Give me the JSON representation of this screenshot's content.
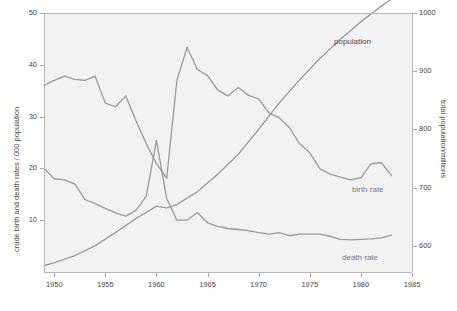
{
  "chart_data": {
    "type": "line",
    "title": "",
    "xlabel": "",
    "ylabel": "crude birth and death rates / 000 population",
    "y2label": "total population/millions",
    "xlim": [
      1949,
      1985
    ],
    "ylim": [
      0,
      50
    ],
    "y2lim": [
      555,
      1000
    ],
    "grid": false,
    "legend_position": "inline-annotations",
    "xticks": [
      "1950",
      "1955",
      "1960",
      "1965",
      "1970",
      "1975",
      "1980",
      "1985"
    ],
    "xtick_values": [
      1950,
      1955,
      1960,
      1965,
      1970,
      1975,
      1980,
      1985
    ],
    "yticks": [
      "10",
      "20",
      "30",
      "40",
      "50"
    ],
    "ytick_values": [
      10,
      20,
      30,
      40,
      50
    ],
    "y2ticks": [
      "600",
      "700",
      "800",
      "900",
      "1000"
    ],
    "y2tick_values": [
      600,
      700,
      800,
      900,
      1000
    ],
    "annotations": [
      {
        "text": "population",
        "x": 1977.5,
        "y_axis": "right"
      },
      {
        "text": "birth rate",
        "x": 1979.0,
        "y_axis": "left"
      },
      {
        "text": "death rate",
        "x": 1978.0,
        "y_axis": "left"
      }
    ],
    "series": [
      {
        "name": "birth rate",
        "axis": "left",
        "color": "#9a9a9a",
        "x": [
          1949,
          1950,
          1951,
          1952,
          1953,
          1954,
          1955,
          1956,
          1957,
          1958,
          1959,
          1960,
          1961,
          1962,
          1963,
          1964,
          1965,
          1966,
          1967,
          1968,
          1969,
          1970,
          1971,
          1972,
          1973,
          1974,
          1975,
          1976,
          1977,
          1978,
          1979,
          1980,
          1981,
          1982,
          1983
        ],
        "values": [
          36.0,
          37.0,
          37.8,
          37.2,
          37.0,
          37.8,
          32.6,
          31.9,
          34.0,
          29.2,
          24.8,
          20.9,
          18.1,
          37.0,
          43.4,
          39.1,
          37.9,
          35.1,
          34.0,
          35.6,
          34.1,
          33.4,
          30.7,
          29.8,
          27.9,
          24.8,
          23.0,
          19.9,
          18.9,
          18.3,
          17.8,
          18.2,
          20.9,
          21.1,
          18.6
        ]
      },
      {
        "name": "death rate",
        "axis": "left",
        "color": "#9a9a9a",
        "x": [
          1949,
          1950,
          1951,
          1952,
          1953,
          1954,
          1955,
          1956,
          1957,
          1958,
          1959,
          1960,
          1961,
          1962,
          1963,
          1964,
          1965,
          1966,
          1967,
          1968,
          1969,
          1970,
          1971,
          1972,
          1973,
          1974,
          1975,
          1976,
          1977,
          1978,
          1979,
          1980,
          1981,
          1982,
          1983
        ],
        "values": [
          20.0,
          18.0,
          17.8,
          17.0,
          14.0,
          13.2,
          12.3,
          11.4,
          10.8,
          11.9,
          14.6,
          25.4,
          14.2,
          10.0,
          10.0,
          11.5,
          9.5,
          8.8,
          8.4,
          8.2,
          8.0,
          7.6,
          7.3,
          7.6,
          7.0,
          7.3,
          7.3,
          7.3,
          6.9,
          6.3,
          6.2,
          6.3,
          6.4,
          6.6,
          7.1
        ]
      },
      {
        "name": "population",
        "axis": "right",
        "color": "#8c8c8c",
        "x": [
          1949,
          1950,
          1952,
          1954,
          1956,
          1958,
          1960,
          1961,
          1962,
          1964,
          1966,
          1968,
          1970,
          1972,
          1974,
          1976,
          1978,
          1980,
          1982,
          1983
        ],
        "values": [
          566,
          571,
          583,
          600,
          623,
          647,
          668,
          665,
          671,
          693,
          723,
          757,
          800,
          845,
          885,
          922,
          955,
          985,
          1012,
          1024
        ]
      }
    ]
  },
  "axes": {
    "y_title": "crude birth and death rates / 000 population",
    "y2_title": "total population/millions"
  },
  "labels": {
    "population": "population",
    "birth_rate": "birth rate",
    "death_rate": "death rate"
  }
}
